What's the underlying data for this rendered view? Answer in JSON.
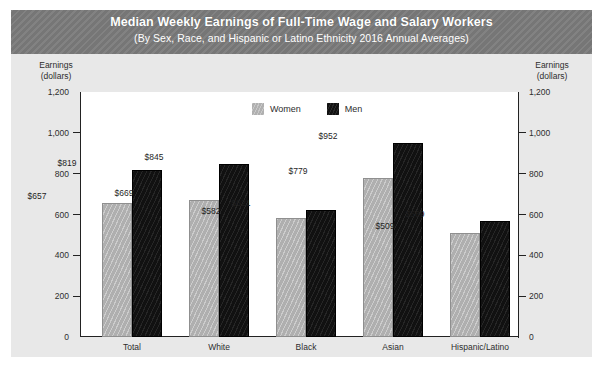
{
  "header": {
    "title": "Median Weekly Earnings of Full-Time Wage and Salary Workers",
    "subtitle": "(By Sex, Race, and Hispanic or Latino Ethnicity 2016 Annual Averages)"
  },
  "axis_caption": {
    "line1": "Earnings",
    "line2": "(dollars)"
  },
  "colors": {
    "header_band": "#7b7b7b",
    "panel_background": "#e8e8e8",
    "plot_background": "#ffffff",
    "women_bar": "#b2b2b2",
    "men_bar": "#111111",
    "axis": "#222222",
    "text": "#2d2d2d"
  },
  "chart_data": {
    "type": "bar",
    "title": "Median Weekly Earnings of Full-Time Wage and Salary Workers",
    "subtitle": "(By Sex, Race, and Hispanic or Latino Ethnicity 2016 Annual Averages)",
    "xlabel": "",
    "ylabel": "Earnings (dollars)",
    "ylim": [
      0,
      1200
    ],
    "yticks": [
      0,
      200,
      400,
      600,
      800,
      1000,
      1200
    ],
    "ytick_labels": [
      "0",
      "200",
      "400",
      "600",
      "800",
      "1,000",
      "1,200"
    ],
    "grid": false,
    "legend_position": "top-center",
    "dual_y_axis": true,
    "categories": [
      "Total",
      "White",
      "Black",
      "Asian",
      "Hispanic/Latino"
    ],
    "series": [
      {
        "name": "Women",
        "color": "#b2b2b2",
        "values": [
          657,
          669,
          582,
          779,
          509
        ],
        "labels": [
          "$657",
          "$669",
          "$582",
          "$779",
          "$509"
        ]
      },
      {
        "name": "Men",
        "color": "#111111",
        "values": [
          819,
          845,
          621,
          952,
          569
        ],
        "labels": [
          "$819",
          "$845",
          "$621",
          "$952",
          "$569"
        ]
      }
    ]
  }
}
